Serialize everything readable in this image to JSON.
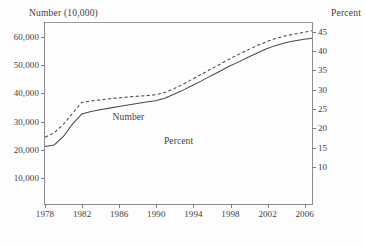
{
  "chart_data": {
    "type": "line",
    "title": "",
    "xlabel": "",
    "ylabel": "Number (10,000)",
    "y2label": "Percent",
    "grid": false,
    "legend_position": "inline-annotation",
    "xlim": [
      1978,
      2007
    ],
    "ylim": [
      0,
      65000
    ],
    "y2lim": [
      0,
      47.2
    ],
    "xticks": [
      1978,
      1982,
      1986,
      1990,
      1994,
      1998,
      2002,
      2006
    ],
    "xticklabels": [
      "1978",
      "1982",
      "1986",
      "1990",
      "1994",
      "1998",
      "2002",
      "2006"
    ],
    "yticks": [
      10000,
      20000,
      30000,
      40000,
      50000,
      60000
    ],
    "yticklabels": [
      "10,000",
      "20,000",
      "30,000",
      "40,000",
      "50,000",
      "60,000"
    ],
    "y2ticks": [
      10,
      15,
      20,
      25,
      30,
      35,
      40,
      45
    ],
    "y2ticklabels": [
      "10",
      "15",
      "20",
      "25",
      "30",
      "35",
      "40",
      "45"
    ],
    "x": [
      1978,
      1979,
      1980,
      1981,
      1982,
      1983,
      1984,
      1985,
      1986,
      1987,
      1988,
      1989,
      1990,
      1991,
      1992,
      1993,
      1994,
      1995,
      1996,
      1997,
      1998,
      1999,
      2000,
      2001,
      2002,
      2003,
      2004,
      2005,
      2006,
      2007
    ],
    "series": [
      {
        "name": "Number",
        "axis": "left",
        "style": "dashed",
        "color": "#4a4a4a",
        "label_text": "Number",
        "values": [
          24000,
          25600,
          28600,
          32600,
          36500,
          37000,
          37400,
          37800,
          38100,
          38400,
          38700,
          38900,
          39200,
          40000,
          41400,
          43000,
          44800,
          46600,
          48400,
          50200,
          52000,
          53700,
          55300,
          56800,
          58200,
          59400,
          60300,
          61000,
          61600,
          62200
        ]
      },
      {
        "name": "Percent",
        "axis": "right",
        "style": "solid",
        "color": "#4a4a4a",
        "label_text": "Percent",
        "values": [
          15.0,
          15.4,
          17.6,
          20.9,
          23.5,
          24.1,
          24.6,
          25.0,
          25.4,
          25.8,
          26.2,
          26.6,
          26.9,
          27.6,
          28.6,
          29.7,
          30.9,
          32.1,
          33.4,
          34.6,
          35.9,
          37.0,
          38.2,
          39.3,
          40.4,
          41.3,
          42.0,
          42.5,
          42.9,
          43.2
        ]
      }
    ],
    "annotations": [
      {
        "text": "Number",
        "x": 1987.0,
        "y_frac": 0.515,
        "series": "Number"
      },
      {
        "text": "Percent",
        "x": 1992.4,
        "y_frac": 0.645,
        "series": "Percent"
      }
    ]
  }
}
